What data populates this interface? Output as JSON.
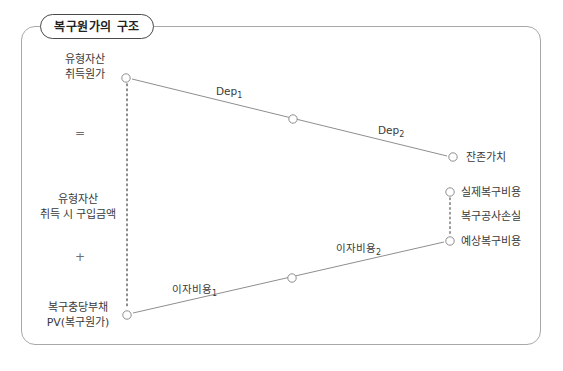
{
  "figure": {
    "title": "복구원가의 구조",
    "frame_color": "#a8a8a8",
    "title_border_color": "#4a4a4a",
    "line_color": "#8e8e8e",
    "text_color": "#3a3a3a"
  },
  "left_stack": {
    "top_label_line1": "유형자산",
    "top_label_line2": "취득원가",
    "operator_equals": "=",
    "mid_label_line1": "유형자산",
    "mid_label_line2": "취득 시 구입금액",
    "operator_plus": "+",
    "bottom_label_line1": "복구충당부채",
    "bottom_label_line2": "PV(복구원가)"
  },
  "right_labels": {
    "residual_value": "잔존가치",
    "actual_restoration_cost": "실제복구비용",
    "restoration_loss": "복구공사손실",
    "expected_restoration_cost": "예상복구비용"
  },
  "line_labels": {
    "dep1_text": "Dep",
    "dep1_sub": "1",
    "dep2_text": "Dep",
    "dep2_sub": "2",
    "interest1_text": "이자비용",
    "interest1_sub": "1",
    "interest2_text": "이자비용",
    "interest2_sub": "2"
  },
  "nodes": {
    "acquisition_cost": {
      "x": 126,
      "y": 78
    },
    "dep_midpoint": {
      "x": 293,
      "y": 119
    },
    "residual_value": {
      "x": 453,
      "y": 157
    },
    "actual_restoration": {
      "x": 450,
      "y": 192
    },
    "expected_restoration": {
      "x": 450,
      "y": 241
    },
    "interest_midpoint": {
      "x": 292,
      "y": 278
    },
    "provision_pv": {
      "x": 127,
      "y": 315
    }
  }
}
